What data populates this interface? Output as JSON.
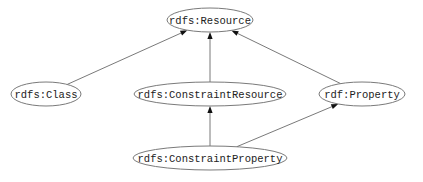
{
  "diagram": {
    "type": "class-hierarchy-graph",
    "nodes": [
      {
        "id": "resource",
        "label": "rdfs:Resource",
        "cx": 210,
        "cy": 20,
        "rx": 43,
        "ry": 12
      },
      {
        "id": "class",
        "label": "rdfs:Class",
        "cx": 46,
        "cy": 94,
        "rx": 35,
        "ry": 12
      },
      {
        "id": "constraint_resource",
        "label": "rdfs:ConstraintResource",
        "cx": 210,
        "cy": 94,
        "rx": 76,
        "ry": 12
      },
      {
        "id": "property",
        "label": "rdf:Property",
        "cx": 362,
        "cy": 94,
        "rx": 43,
        "ry": 12
      },
      {
        "id": "constraint_property",
        "label": "rdfs:ConstraintProperty",
        "cx": 210,
        "cy": 158,
        "rx": 77,
        "ry": 12
      }
    ],
    "edges": [
      {
        "from": "class",
        "to": "resource"
      },
      {
        "from": "constraint_resource",
        "to": "resource"
      },
      {
        "from": "property",
        "to": "resource"
      },
      {
        "from": "constraint_property",
        "to": "constraint_resource"
      },
      {
        "from": "constraint_property",
        "to": "property"
      }
    ],
    "colors": {
      "node_stroke": "#7a7a7a",
      "edge_stroke": "#6a6a6a",
      "arrow_fill": "#111111",
      "text": "#222222",
      "background": "#ffffff"
    }
  }
}
